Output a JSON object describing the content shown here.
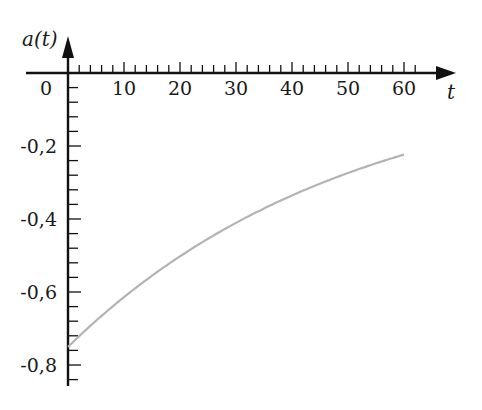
{
  "chart_data": {
    "type": "line",
    "title": "",
    "xlabel": "t",
    "ylabel": "a(t)",
    "xlim": [
      -6,
      70
    ],
    "ylim": [
      -0.87,
      0.1
    ],
    "x_ticks": [
      0,
      10,
      20,
      30,
      40,
      50,
      60
    ],
    "x_tick_labels": [
      "0",
      "10",
      "20",
      "30",
      "40",
      "50",
      "60"
    ],
    "x_minor_step": 2,
    "y_ticks": [
      -0.2,
      -0.4,
      -0.6,
      -0.8
    ],
    "y_tick_labels": [
      "-0,2",
      "-0,4",
      "-0,6",
      "-0,8"
    ],
    "y_minor_step": 0.04,
    "grid": false,
    "legend": null,
    "series": [
      {
        "name": "a(t)",
        "color": "#b3b3b3",
        "x": [
          0,
          5,
          10,
          15,
          20,
          25,
          30,
          35,
          40,
          45,
          50,
          55,
          60
        ],
        "values": [
          -0.756,
          -0.684,
          -0.619,
          -0.561,
          -0.507,
          -0.459,
          -0.416,
          -0.376,
          -0.341,
          -0.308,
          -0.279,
          -0.253,
          -0.229
        ]
      }
    ]
  },
  "labels": {
    "y_axis": "a(t)",
    "x_axis": "t",
    "origin": "0"
  },
  "colors": {
    "axis": "#111111",
    "curve": "#b3b3b3",
    "text": "#1a1a1a"
  }
}
